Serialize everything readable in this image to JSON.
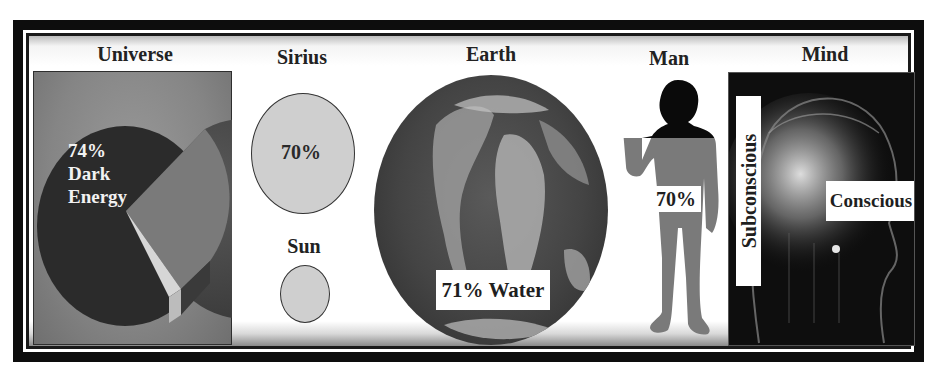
{
  "figure": {
    "theme": "Water / composition proportions across scales",
    "colors": {
      "frame": "#0d0d0d",
      "panel_bg": "#ffffff",
      "pie_dark": "#4a4a4a",
      "pie_mid": "#7c7c7c",
      "pie_light": "#d8d8d8",
      "sphere_fill": "#cfcfcf",
      "man_head": "#0a0a0a",
      "man_body": "#7a7a7a",
      "mind_bg": "#0e0e0e"
    }
  },
  "panels": {
    "universe": {
      "title": "Universe",
      "pie": {
        "label_percent": "74%",
        "label_line1": "Dark",
        "label_line2": "Energy"
      }
    },
    "sirius": {
      "title": "Sirius",
      "value": "70%"
    },
    "sun": {
      "title": "Sun"
    },
    "earth": {
      "title": "Earth",
      "label": "71% Water"
    },
    "man": {
      "title": "Man",
      "value": "70%"
    },
    "mind": {
      "title": "Mind",
      "label_vertical": "Subconscious",
      "label_horizontal": "Conscious"
    }
  }
}
